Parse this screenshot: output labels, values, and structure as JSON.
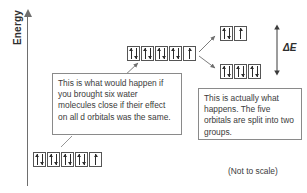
{
  "diagram": {
    "axis": {
      "label": "Energy",
      "arrow_direction": "up"
    },
    "footnote": "(Not to scale)",
    "delta_label": "ΔE",
    "colors": {
      "text": "#3b3b3b",
      "box_border": "#555555",
      "axis": "#6e6e6e",
      "arrow": "#2b2b2b",
      "background": "#ffffff"
    },
    "levels": [
      {
        "id": "ground",
        "name": "free-ion-ground-level",
        "orbital_count": 5,
        "orbitals": [
          "up-down",
          "up-down",
          "up-down",
          "up-down",
          "up"
        ]
      },
      {
        "id": "spherical",
        "name": "spherical-field-level",
        "orbital_count": 5,
        "orbitals": [
          "up-down",
          "up-down",
          "up-down",
          "up-down",
          "up"
        ]
      },
      {
        "id": "eg",
        "name": "upper-split-level",
        "orbital_count": 2,
        "orbitals": [
          "up-down",
          "up"
        ]
      },
      {
        "id": "t2g",
        "name": "lower-split-level",
        "orbital_count": 3,
        "orbitals": [
          "up-down",
          "up-down",
          "up-down"
        ]
      }
    ],
    "callouts": [
      {
        "id": "left",
        "text": "This is what would happen if you brought six water molecules close if their effect on all d orbitals was the same."
      },
      {
        "id": "right",
        "text": "This is actually what happens. The five orbitals are split into two groups."
      }
    ]
  }
}
